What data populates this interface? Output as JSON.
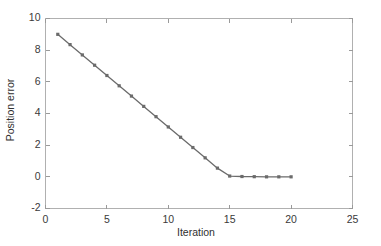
{
  "chart_data": {
    "type": "line",
    "title": "",
    "xlabel": "Iteration",
    "ylabel": "Position error",
    "xlim": [
      0,
      25
    ],
    "ylim": [
      -2,
      10
    ],
    "xticks": [
      0,
      5,
      10,
      15,
      20,
      25
    ],
    "yticks": [
      -2,
      0,
      2,
      4,
      6,
      8,
      10
    ],
    "xticklabels": [
      "0",
      "5",
      "10",
      "15",
      "20",
      "25"
    ],
    "yticklabels": [
      "-2",
      "0",
      "2",
      "4",
      "6",
      "8",
      "10"
    ],
    "grid": false,
    "legend": null,
    "series": [
      {
        "name": "Position error",
        "color": "#6b6b6b",
        "marker": "square",
        "x": [
          1,
          2,
          3,
          4,
          5,
          6,
          7,
          8,
          9,
          10,
          11,
          12,
          13,
          14,
          15,
          16,
          17,
          18,
          19,
          20
        ],
        "values": [
          9.0,
          8.35,
          7.7,
          7.05,
          6.4,
          5.75,
          5.1,
          4.45,
          3.8,
          3.15,
          2.5,
          1.85,
          1.2,
          0.55,
          0.05,
          0.02,
          0.01,
          0.0,
          0.0,
          0.0
        ]
      }
    ]
  },
  "axes": {
    "x_label": "Iteration",
    "y_label": "Position error"
  },
  "colors": {
    "series": "#6b6b6b",
    "axis": "#b0b0b0",
    "background": "#ffffff",
    "text": "#3a3a3a"
  }
}
